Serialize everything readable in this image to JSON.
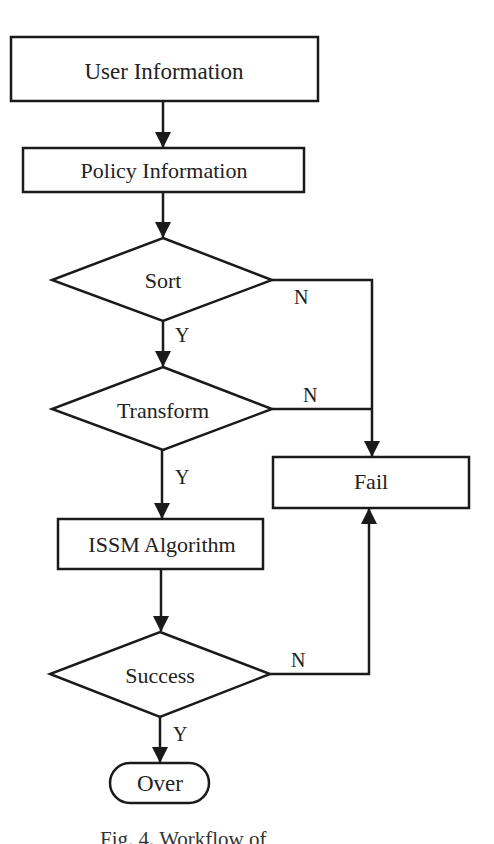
{
  "diagram": {
    "type": "flowchart",
    "stroke_color": "#1a1a1a",
    "background_color": "#ffffff",
    "nodes": {
      "user_information": {
        "label": "User Information",
        "shape": "rectangle"
      },
      "policy_information": {
        "label": "Policy Information",
        "shape": "rectangle"
      },
      "sort": {
        "label": "Sort",
        "shape": "diamond"
      },
      "transform": {
        "label": "Transform",
        "shape": "diamond"
      },
      "issm_algorithm": {
        "label": "ISSM Algorithm",
        "shape": "rectangle"
      },
      "success": {
        "label": "Success",
        "shape": "diamond"
      },
      "fail": {
        "label": "Fail",
        "shape": "rectangle"
      },
      "over": {
        "label": "Over",
        "shape": "rounded-terminal"
      }
    },
    "edges": {
      "user_to_policy": {
        "from": "User Information",
        "to": "Policy Information",
        "label": ""
      },
      "policy_to_sort": {
        "from": "Policy Information",
        "to": "Sort",
        "label": ""
      },
      "sort_yes": {
        "from": "Sort",
        "to": "Transform",
        "label": "Y"
      },
      "sort_no": {
        "from": "Sort",
        "to": "Fail",
        "label": "N"
      },
      "transform_yes": {
        "from": "Transform",
        "to": "ISSM Algorithm",
        "label": "Y"
      },
      "transform_no": {
        "from": "Transform",
        "to": "Fail",
        "label": "N"
      },
      "issm_to_success": {
        "from": "ISSM Algorithm",
        "to": "Success",
        "label": ""
      },
      "success_yes": {
        "from": "Success",
        "to": "Over",
        "label": "Y"
      },
      "success_no": {
        "from": "Success",
        "to": "Fail",
        "label": "N"
      }
    },
    "caption": "Fig. 4. Workflow of"
  }
}
